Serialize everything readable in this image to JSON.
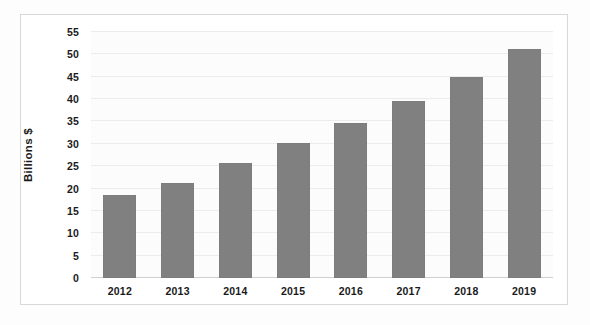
{
  "chart_data": {
    "type": "bar",
    "title": "",
    "subtitle": "",
    "xlabel": "",
    "ylabel": "Billions $",
    "categories": [
      "2012",
      "2013",
      "2014",
      "2015",
      "2016",
      "2017",
      "2018",
      "2019"
    ],
    "values": [
      18.5,
      21.2,
      25.8,
      30.2,
      34.6,
      39.5,
      45.0,
      51.2
    ],
    "series": [
      {
        "name": "Billions $",
        "values": [
          18.5,
          21.2,
          25.8,
          30.2,
          34.6,
          39.5,
          45.0,
          51.2
        ]
      }
    ],
    "ylim": [
      0,
      55
    ],
    "ytick_step": 5,
    "yticks": [
      0,
      5,
      10,
      15,
      20,
      25,
      30,
      35,
      40,
      45,
      50,
      55
    ],
    "ytick_labels": [
      "0",
      "5",
      "10",
      "15",
      "20",
      "25",
      "30",
      "35",
      "40",
      "45",
      "50",
      "55"
    ],
    "grid": true,
    "grid_axis": "y",
    "legend": false,
    "legend_position": "none",
    "annotations": [],
    "bar_color": "#808080",
    "gridline_color": "#ececec",
    "axis_color": "#d0d0d0",
    "plot_background": "#fcfcfc",
    "text_color": "#1a1a1a",
    "frame_border_color": "#d8d8d8"
  }
}
